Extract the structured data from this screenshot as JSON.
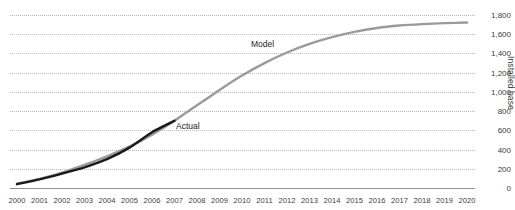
{
  "title": "",
  "axes": {
    "y_label": "Installed base",
    "y_ticks": [
      "0",
      "200",
      "400",
      "600",
      "800",
      "1,000",
      "1,200",
      "1,400",
      "1,600",
      "1,800"
    ],
    "x_ticks": [
      "2000",
      "2001",
      "2002",
      "2003",
      "2004",
      "2005",
      "2006",
      "2007",
      "2008",
      "2009",
      "2010",
      "2011",
      "2012",
      "2013",
      "2014",
      "2015",
      "2016",
      "2017",
      "2018",
      "2019",
      "2020"
    ]
  },
  "annotations": {
    "model": "Model",
    "actual": "Actual"
  },
  "colors": {
    "model": "#9a9a9a",
    "actual": "#1a1a1a",
    "grid": "#b9b9b9",
    "axis": "#8e8e8e",
    "text": "#3d3d3d",
    "background": "#ffffff"
  },
  "chart_data": {
    "type": "line",
    "title": "",
    "xlabel": "",
    "ylabel": "Installed base",
    "xlim": [
      2000,
      2020
    ],
    "ylim": [
      0,
      1800
    ],
    "grid": true,
    "grid_axis": "y",
    "legend": "inline-annotations",
    "x": [
      2000,
      2001,
      2002,
      2003,
      2004,
      2005,
      2006,
      2007,
      2008,
      2009,
      2010,
      2011,
      2012,
      2013,
      2014,
      2015,
      2016,
      2017,
      2018,
      2019,
      2020
    ],
    "series": [
      {
        "name": "Model",
        "color": "#9a9a9a",
        "values": [
          45,
          95,
          160,
          240,
          330,
          430,
          555,
          700,
          860,
          1020,
          1170,
          1300,
          1410,
          1500,
          1570,
          1625,
          1665,
          1690,
          1705,
          1715,
          1722
        ]
      },
      {
        "name": "Actual",
        "color": "#1a1a1a",
        "values": [
          40,
          90,
          150,
          215,
          300,
          420,
          580,
          700,
          null,
          null,
          null,
          null,
          null,
          null,
          null,
          null,
          null,
          null,
          null,
          null,
          null
        ]
      }
    ]
  }
}
